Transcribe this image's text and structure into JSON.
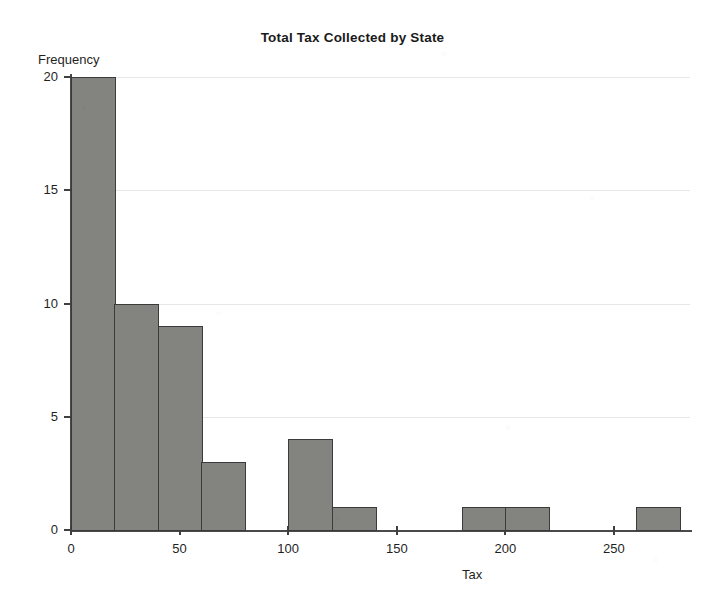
{
  "chart_data": {
    "type": "bar",
    "title": "Total Tax Collected by State",
    "xlabel": "Tax",
    "ylabel": "Frequency",
    "grid": true,
    "legend_position": "none",
    "xlim": [
      0,
      285
    ],
    "ylim": [
      0,
      20
    ],
    "xticks": [
      0,
      50,
      100,
      150,
      200,
      250
    ],
    "yticks": [
      0,
      5,
      10,
      15,
      20
    ],
    "bin_width": 20,
    "bin_edges": [
      0,
      20,
      40,
      60,
      80,
      100,
      120,
      140,
      160,
      180,
      200,
      220,
      240,
      260,
      280
    ],
    "categories": [
      "0-20",
      "20-40",
      "40-60",
      "60-80",
      "80-100",
      "100-120",
      "120-140",
      "140-160",
      "160-180",
      "180-200",
      "200-220",
      "220-240",
      "240-260",
      "260-280"
    ],
    "values": [
      20,
      10,
      9,
      3,
      0,
      4,
      1,
      0,
      0,
      1,
      1,
      0,
      0,
      1
    ],
    "bars": [
      {
        "label": "0-20",
        "x0": 0,
        "x1": 20,
        "value": 20
      },
      {
        "label": "20-40",
        "x0": 20,
        "x1": 40,
        "value": 10
      },
      {
        "label": "40-60",
        "x0": 40,
        "x1": 60,
        "value": 9
      },
      {
        "label": "60-80",
        "x0": 60,
        "x1": 80,
        "value": 3
      },
      {
        "label": "100-120",
        "x0": 100,
        "x1": 120,
        "value": 4
      },
      {
        "label": "120-140",
        "x0": 120,
        "x1": 140,
        "value": 1
      },
      {
        "label": "180-200",
        "x0": 180,
        "x1": 200,
        "value": 1
      },
      {
        "label": "200-220",
        "x0": 200,
        "x1": 220,
        "value": 1
      },
      {
        "label": "260-280",
        "x0": 260,
        "x1": 280,
        "value": 1
      }
    ],
    "colors": {
      "bar_fill": "#83837f",
      "bar_outline": "#3b3b3b",
      "axis": "#4a4a4a",
      "grid": "#c8c8ce",
      "text": "#1f1f1f",
      "background": "#ffffff"
    }
  },
  "axis": {
    "y_tick_labels": [
      "0",
      "5",
      "10",
      "15",
      "20"
    ],
    "x_tick_labels": [
      "0",
      "50",
      "100",
      "150",
      "200",
      "250"
    ]
  }
}
